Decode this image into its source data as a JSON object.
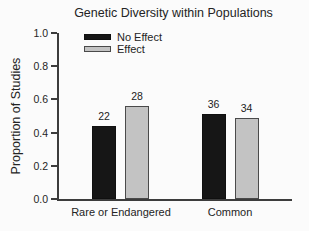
{
  "figure": {
    "background": "#fbfbfb"
  },
  "chart_data": {
    "type": "bar",
    "title": "Genetic Diversity within Populations",
    "ylabel": "Proportion of Studies",
    "xlabel": "",
    "categories": [
      "Rare or Endangered",
      "Common"
    ],
    "series": [
      {
        "name": "No Effect",
        "color": "#161616",
        "values": [
          0.44,
          0.51
        ],
        "counts": [
          22,
          36
        ]
      },
      {
        "name": "Effect",
        "color": "#c3c3c3",
        "values": [
          0.56,
          0.49
        ],
        "counts": [
          28,
          34
        ]
      }
    ],
    "bar_labels": [
      22,
      28,
      36,
      34
    ],
    "ylim": [
      0.0,
      1.0
    ],
    "ytick_labels": [
      "1.0",
      "0.8",
      "0.6",
      "0.4",
      "0.2",
      "0.0"
    ],
    "grid": false,
    "legend_position": "upper-left-inside",
    "colors": {
      "axis": "#3c3c3c",
      "text": "#242424",
      "bar_border": "#4a4a4a"
    }
  }
}
